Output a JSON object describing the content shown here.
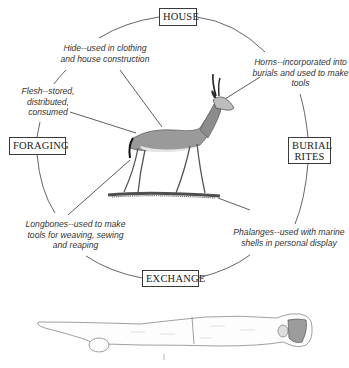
{
  "diagram": {
    "type": "cycle-diagram",
    "categories": {
      "house": "HOUSE",
      "burial_rites": "BURIAL\nRITES",
      "exchange": "EXCHANGE",
      "foraging": "FORAGING"
    },
    "annotations": {
      "hide": "Hide--used in clothing\nand house construction",
      "horns": "Horns--incorporated into\nburials and used to make\ntools",
      "flesh": "Flesh--stored,\ndistributed,\nconsumed",
      "longbones": "Longbones--used to make\ntools for weaving, sewing\nand reaping",
      "phalanges": "Phalanges--used with marine\nshells in personal display"
    },
    "colors": {
      "line": "#4a4a4a",
      "box_border": "#3a3a3a",
      "text": "#333333",
      "background": "#ffffff"
    }
  }
}
